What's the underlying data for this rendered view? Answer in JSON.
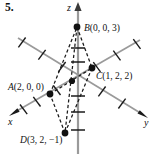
{
  "figure": {
    "number_label": "5.",
    "domain_kind": "diagram"
  },
  "axes": {
    "z_label": "z",
    "x_label": "x",
    "y_label": "y",
    "axis_color": "#8d8d8d",
    "tick_color": "#1a1a1a"
  },
  "points": [
    {
      "id": "A",
      "name_text": "A",
      "coord_text": "(2, 0, 0)",
      "label_text": "A(2, 0, 0)",
      "px": 50,
      "py": 94,
      "coords": [
        2,
        0,
        0
      ]
    },
    {
      "id": "B",
      "name_text": "B",
      "coord_text": "(0, 0, 3)",
      "label_text": "B(0, 0, 3)",
      "px": 77,
      "py": 27,
      "coords": [
        0,
        0,
        3
      ]
    },
    {
      "id": "C",
      "name_text": "C",
      "coord_text": "(1, 2, 2)",
      "label_text": "C(1, 2, 2)",
      "px": 92,
      "py": 68,
      "coords": [
        1,
        2,
        2
      ]
    },
    {
      "id": "D",
      "name_text": "D",
      "coord_text": "(3, 2, −1)",
      "label_text": "D(3, 2, −1)",
      "px": 65,
      "py": 133,
      "coords": [
        3,
        2,
        -1
      ]
    },
    {
      "id": "M",
      "name_text": "",
      "coord_text": "",
      "label_text": "",
      "px": 72,
      "py": 81,
      "coords": null
    }
  ],
  "edges": [
    {
      "from": "A",
      "to": "B",
      "style": "dashed"
    },
    {
      "from": "B",
      "to": "C",
      "style": "dashed"
    },
    {
      "from": "C",
      "to": "D",
      "style": "dashed"
    },
    {
      "from": "D",
      "to": "A",
      "style": "dashed"
    },
    {
      "from": "A",
      "to": "C",
      "style": "dashed"
    },
    {
      "from": "B",
      "to": "D",
      "style": "dashed"
    }
  ],
  "colors": {
    "ink": "#111111",
    "axis_gray": "#8d8d8d",
    "background": "#ffffff"
  }
}
